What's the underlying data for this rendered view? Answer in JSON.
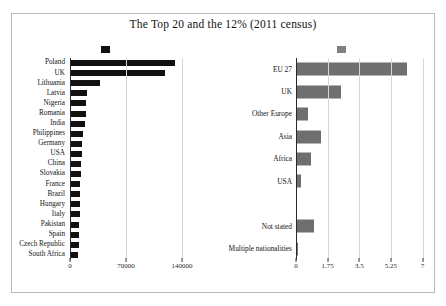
{
  "figure": {
    "title": "The Top 20 and the 12% (2011 census)",
    "border_color": "#b9b9b9",
    "background": "#ffffff"
  },
  "legend": {
    "items": [
      {
        "name": "top-20-marker",
        "color": "#111111"
      },
      {
        "name": "twelve-percent-marker",
        "color": "#808080"
      }
    ]
  },
  "chart_data": [
    {
      "type": "bar",
      "orientation": "horizontal",
      "panel": "left",
      "title": "The Top 20 and the 12% (2011 census)",
      "xlabel": "",
      "ylabel": "",
      "color": "#111111",
      "grid": true,
      "xlim": [
        0,
        175000
      ],
      "xticks": [
        0,
        70000,
        140000
      ],
      "xticklabels": [
        "0",
        "70000",
        "140000"
      ],
      "categories": [
        "Poland",
        "UK",
        "Lithuania",
        "Latvia",
        "Nigeria",
        "Romania",
        "India",
        "Philippines",
        "Germany",
        "USA",
        "China",
        "Slovakia",
        "France",
        "Brazil",
        "Hungary",
        "Italy",
        "Pakistan",
        "Spain",
        "Czech Republic",
        "South Africa"
      ],
      "values": [
        131500,
        118700,
        36700,
        20600,
        19200,
        18400,
        17800,
        15100,
        13900,
        13300,
        12600,
        12400,
        11900,
        11500,
        11300,
        11000,
        10600,
        10300,
        9600,
        8800
      ]
    },
    {
      "type": "bar",
      "orientation": "horizontal",
      "panel": "right",
      "title": "",
      "xlabel": "",
      "ylabel": "",
      "color": "#6f6f6f",
      "grid": true,
      "xlim": [
        0,
        7.3
      ],
      "xticks": [
        0,
        1.75,
        3.5,
        5.25,
        7
      ],
      "xticklabels": [
        "0",
        "1.75",
        "3.5",
        "5.25",
        "7"
      ],
      "categories": [
        "EU 27",
        "UK",
        "Other Europe",
        "Asia",
        "Africa",
        "USA",
        "",
        "Not stated",
        "Multiple nationalities"
      ],
      "values": [
        6.13,
        2.45,
        0.62,
        1.35,
        0.78,
        0.2,
        0,
        0.92,
        0.06
      ]
    }
  ]
}
